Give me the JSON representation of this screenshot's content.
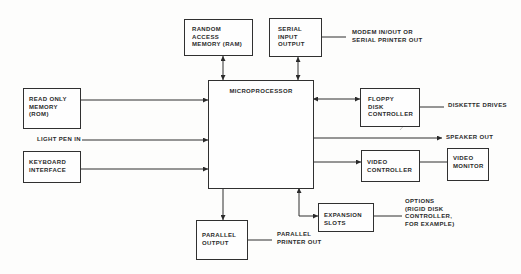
{
  "diagram": {
    "blocks": {
      "ram": {
        "lines": [
          "RANDOM",
          "ACCESS",
          "MEMORY (RAM)"
        ]
      },
      "serial_io": {
        "lines": [
          "SERIAL",
          "INPUT",
          "OUTPUT"
        ]
      },
      "microprocessor": {
        "lines": [
          "MICROPROCESSOR"
        ]
      },
      "rom": {
        "lines": [
          "READ ONLY",
          "MEMORY",
          "(ROM)"
        ]
      },
      "keyboard": {
        "lines": [
          "KEYBOARD",
          "INTERFACE"
        ]
      },
      "floppy": {
        "lines": [
          "FLOPPY",
          "DISK",
          "CONTROLLER"
        ]
      },
      "video_controller": {
        "lines": [
          "VIDEO",
          "CONTROLLER"
        ]
      },
      "video_monitor": {
        "lines": [
          "VIDEO",
          "MONITOR"
        ]
      },
      "expansion": {
        "lines": [
          "EXPANSION",
          "SLOTS"
        ]
      },
      "parallel_output": {
        "lines": [
          "PARALLEL",
          "OUTPUT"
        ]
      }
    },
    "labels": {
      "serial_out": [
        "MODEM IN/OUT OR",
        "SERIAL PRINTER OUT"
      ],
      "diskette": [
        "DISKETTE DRIVES"
      ],
      "speaker": [
        "SPEAKER OUT"
      ],
      "light_pen": [
        "LIGHT PEN IN"
      ],
      "parallel_printer": [
        "PARALLEL",
        "PRINTER OUT"
      ],
      "options": [
        "OPTIONS",
        "(RIGID DISK",
        "CONTROLLER,",
        "FOR EXAMPLE)"
      ]
    },
    "connections": [
      {
        "from": "ram",
        "to": "microprocessor",
        "type": "bidirectional"
      },
      {
        "from": "serial_io",
        "to": "microprocessor",
        "type": "bidirectional"
      },
      {
        "from": "serial_io",
        "to": "serial_out",
        "type": "line"
      },
      {
        "from": "rom",
        "to": "microprocessor",
        "type": "arrow"
      },
      {
        "from": "light_pen",
        "to": "microprocessor",
        "type": "arrow"
      },
      {
        "from": "keyboard",
        "to": "microprocessor",
        "type": "arrow"
      },
      {
        "from": "microprocessor",
        "to": "floppy",
        "type": "bidirectional"
      },
      {
        "from": "floppy",
        "to": "diskette",
        "type": "line"
      },
      {
        "from": "microprocessor",
        "to": "speaker",
        "type": "arrow"
      },
      {
        "from": "microprocessor",
        "to": "video_controller",
        "type": "arrow"
      },
      {
        "from": "video_controller",
        "to": "video_monitor",
        "type": "line"
      },
      {
        "from": "microprocessor",
        "to": "parallel_output",
        "type": "arrow"
      },
      {
        "from": "parallel_output",
        "to": "parallel_printer",
        "type": "line"
      },
      {
        "from": "microprocessor",
        "to": "expansion",
        "type": "bidirectional"
      },
      {
        "from": "expansion",
        "to": "options",
        "type": "line"
      }
    ],
    "colors": {
      "ink": "#2a2a2a",
      "paper": "#fdfdfc"
    }
  }
}
